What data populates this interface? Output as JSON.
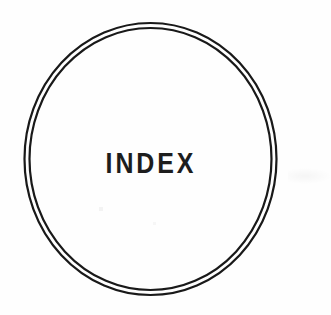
{
  "page": {
    "background_color": "#fefefe",
    "width": 331,
    "height": 315
  },
  "emblem": {
    "name": "double-ring-circle",
    "shape": "circle",
    "ring_count": 2,
    "stroke_color": "#191919",
    "outer_ring": {
      "center_x": 150.5,
      "center_y": 159,
      "radius_x": 126,
      "radius_y": 136,
      "stroke_width": 2.2
    },
    "inner_ring": {
      "center_x": 150.5,
      "center_y": 159,
      "radius_x": 121,
      "radius_y": 131,
      "stroke_width": 2.2
    }
  },
  "wordmark": {
    "text": "INDEX",
    "color": "#1d1d1d",
    "weight": "bold",
    "transform": "uppercase",
    "letter_spacing": "wide"
  }
}
